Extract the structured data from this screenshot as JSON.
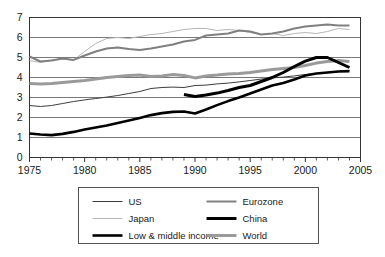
{
  "chart_data": {
    "type": "line",
    "title": "",
    "subtitle": "",
    "xlabel": "",
    "ylabel": "",
    "xlim": [
      1975,
      2005
    ],
    "ylim": [
      0,
      7
    ],
    "grid": "horizontal",
    "legend_position": "bottom",
    "x_ticks": [
      1975,
      1980,
      1985,
      1990,
      1995,
      2000,
      2005
    ],
    "x_tick_labels": [
      "1975",
      "1980",
      "1985",
      "1990",
      "1995",
      "2000",
      "2005"
    ],
    "x_minor_tick_interval": 1,
    "y_ticks": [
      0,
      1,
      2,
      3,
      4,
      5,
      6,
      7
    ],
    "y_tick_labels": [
      "0",
      "1",
      "2",
      "3",
      "4",
      "5",
      "6",
      "7"
    ],
    "series": [
      {
        "name": "US",
        "legend_label": "US",
        "color": "#3d3d3d",
        "width": 1.0,
        "x": [
          1975,
          1976,
          1977,
          1978,
          1979,
          1980,
          1981,
          1982,
          1983,
          1984,
          1985,
          1986,
          1987,
          1988,
          1989,
          1990,
          1991,
          1992,
          1993,
          1994,
          1995,
          1996,
          1997,
          1998,
          1999,
          2000,
          2001,
          2002,
          2003,
          2004
        ],
        "values": [
          2.6,
          2.55,
          2.6,
          2.7,
          2.8,
          2.88,
          2.95,
          3.02,
          3.1,
          3.2,
          3.3,
          3.45,
          3.5,
          3.52,
          3.5,
          3.6,
          3.62,
          3.68,
          3.72,
          3.78,
          3.85,
          3.92,
          3.98,
          4.02,
          4.08,
          4.15,
          4.2,
          4.25,
          4.3,
          4.35
        ]
      },
      {
        "name": "Japan",
        "legend_label": "Japan",
        "color": "#b5b5b5",
        "width": 1.0,
        "x": [
          1975,
          1976,
          1977,
          1978,
          1979,
          1980,
          1981,
          1982,
          1983,
          1984,
          1985,
          1986,
          1987,
          1988,
          1989,
          1990,
          1991,
          1992,
          1993,
          1994,
          1995,
          1996,
          1997,
          1998,
          1999,
          2000,
          2001,
          2002,
          2003,
          2004
        ],
        "values": [
          4.85,
          4.75,
          4.88,
          4.92,
          4.88,
          5.3,
          5.7,
          5.95,
          6.0,
          5.95,
          6.05,
          6.15,
          6.2,
          6.3,
          6.4,
          6.45,
          6.45,
          6.35,
          6.4,
          6.35,
          6.25,
          6.15,
          6.2,
          6.1,
          6.2,
          6.25,
          6.2,
          6.3,
          6.45,
          6.4
        ]
      },
      {
        "name": "Low & middle income",
        "legend_label": "Low & middle income",
        "color": "#000000",
        "width": 2.6,
        "x": [
          1975,
          1976,
          1977,
          1978,
          1979,
          1980,
          1981,
          1982,
          1983,
          1984,
          1985,
          1986,
          1987,
          1988,
          1989,
          1990,
          1991,
          1992,
          1993,
          1994,
          1995,
          1996,
          1997,
          1998,
          1999,
          2000,
          2001,
          2002,
          2003,
          2004
        ],
        "values": [
          1.2,
          1.15,
          1.12,
          1.18,
          1.28,
          1.4,
          1.5,
          1.6,
          1.72,
          1.85,
          1.98,
          2.12,
          2.22,
          2.28,
          2.3,
          2.2,
          2.4,
          2.62,
          2.82,
          3.0,
          3.2,
          3.4,
          3.6,
          3.72,
          3.9,
          4.1,
          4.2,
          4.25,
          4.3,
          4.32
        ]
      },
      {
        "name": "Eurozone",
        "legend_label": "Eurozone",
        "color": "#808080",
        "width": 2.0,
        "x": [
          1975,
          1976,
          1977,
          1978,
          1979,
          1980,
          1981,
          1982,
          1983,
          1984,
          1985,
          1986,
          1987,
          1988,
          1989,
          1990,
          1991,
          1992,
          1993,
          1994,
          1995,
          1996,
          1997,
          1998,
          1999,
          2000,
          2001,
          2002,
          2003,
          2004
        ],
        "values": [
          5.05,
          4.8,
          4.85,
          4.95,
          4.88,
          5.1,
          5.3,
          5.45,
          5.5,
          5.42,
          5.38,
          5.45,
          5.55,
          5.65,
          5.8,
          5.88,
          6.1,
          6.15,
          6.2,
          6.35,
          6.3,
          6.15,
          6.2,
          6.3,
          6.45,
          6.55,
          6.6,
          6.65,
          6.6,
          6.6
        ]
      },
      {
        "name": "China",
        "legend_label": "China",
        "color": "#000000",
        "width": 3.0,
        "x": [
          1989,
          1990,
          1991,
          1992,
          1993,
          1994,
          1995,
          1996,
          1997,
          1998,
          1999,
          2000,
          2001,
          2002,
          2003,
          2004
        ],
        "values": [
          3.15,
          3.05,
          3.12,
          3.22,
          3.35,
          3.5,
          3.6,
          3.8,
          4.0,
          4.25,
          4.55,
          4.82,
          5.0,
          5.0,
          4.75,
          4.5
        ]
      },
      {
        "name": "World",
        "legend_label": "World",
        "color": "#9a9a9a",
        "width": 3.0,
        "x": [
          1975,
          1976,
          1977,
          1978,
          1979,
          1980,
          1981,
          1982,
          1983,
          1984,
          1985,
          1986,
          1987,
          1988,
          1989,
          1990,
          1991,
          1992,
          1993,
          1994,
          1995,
          1996,
          1997,
          1998,
          1999,
          2000,
          2001,
          2002,
          2003,
          2004
        ],
        "values": [
          3.7,
          3.68,
          3.7,
          3.75,
          3.8,
          3.85,
          3.92,
          4.0,
          4.05,
          4.1,
          4.12,
          4.05,
          4.08,
          4.15,
          4.1,
          3.98,
          4.08,
          4.12,
          4.18,
          4.2,
          4.25,
          4.32,
          4.4,
          4.45,
          4.5,
          4.6,
          4.72,
          4.8,
          4.85,
          4.8
        ]
      }
    ]
  },
  "legend": {
    "entries": [
      {
        "label": "US"
      },
      {
        "label": "Eurozone"
      },
      {
        "label": "Japan"
      },
      {
        "label": "China"
      },
      {
        "label": "Low & middle income"
      },
      {
        "label": "World"
      }
    ]
  },
  "colors": {
    "background": "#ffffff",
    "gridline": "#555555",
    "axis": "#333333",
    "text": "#1a1a1a",
    "legend_border": "#555555"
  }
}
